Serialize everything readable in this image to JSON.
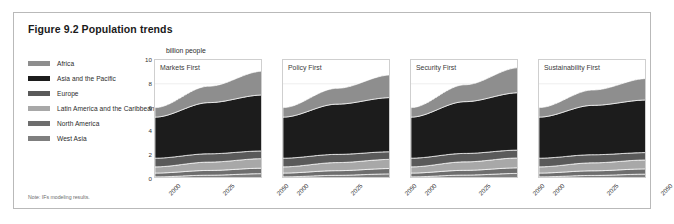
{
  "figure": {
    "title": "Figure 9.2 Population trends",
    "note": "Note: IFs modeling results."
  },
  "legend": {
    "items": [
      {
        "label": "Africa",
        "color": "#8e8e8e"
      },
      {
        "label": "Asia and the Pacific",
        "color": "#1c1c1c"
      },
      {
        "label": "Europe",
        "color": "#5a5a5a"
      },
      {
        "label": "Latin America and the Caribbean",
        "color": "#a8a8a8"
      },
      {
        "label": "North America",
        "color": "#6e6e6e"
      },
      {
        "label": "West Asia",
        "color": "#7f7f7f"
      }
    ]
  },
  "chart_data": {
    "type": "area",
    "title": "Figure 9.2 Population trends",
    "subtitle": "",
    "xlabel": "",
    "ylabel": "billion people",
    "ylim": [
      0,
      10
    ],
    "yticks": [
      10,
      8,
      6,
      4,
      2,
      0
    ],
    "xticks": [
      "2000",
      "2025",
      "2050"
    ],
    "x": [
      2000,
      2025,
      2050
    ],
    "grid": true,
    "legend_position": "left",
    "stack_order": [
      "West Asia",
      "North America",
      "Latin America and the Caribbean",
      "Europe",
      "Asia and the Pacific",
      "Africa"
    ],
    "panels": [
      {
        "title": "Markets First",
        "series": [
          {
            "name": "West Asia",
            "values": [
              0.18,
              0.32,
              0.45
            ],
            "color": "#7f7f7f"
          },
          {
            "name": "North America",
            "values": [
              0.32,
              0.4,
              0.46
            ],
            "color": "#6e6e6e"
          },
          {
            "name": "Latin America and the Caribbean",
            "values": [
              0.52,
              0.7,
              0.8
            ],
            "color": "#a8a8a8"
          },
          {
            "name": "Europe",
            "values": [
              0.73,
              0.7,
              0.65
            ],
            "color": "#5a5a5a"
          },
          {
            "name": "Asia and the Pacific",
            "values": [
              3.45,
              4.3,
              4.7
            ],
            "color": "#1c1c1c"
          },
          {
            "name": "Africa",
            "values": [
              0.8,
              1.38,
              2.0
            ],
            "color": "#8e8e8e"
          }
        ],
        "totals": [
          6.0,
          7.8,
          9.06
        ]
      },
      {
        "title": "Policy First",
        "series": [
          {
            "name": "West Asia",
            "values": [
              0.18,
              0.31,
              0.43
            ],
            "color": "#7f7f7f"
          },
          {
            "name": "North America",
            "values": [
              0.32,
              0.39,
              0.45
            ],
            "color": "#6e6e6e"
          },
          {
            "name": "Latin America and the Caribbean",
            "values": [
              0.52,
              0.68,
              0.77
            ],
            "color": "#a8a8a8"
          },
          {
            "name": "Europe",
            "values": [
              0.73,
              0.69,
              0.64
            ],
            "color": "#5a5a5a"
          },
          {
            "name": "Asia and the Pacific",
            "values": [
              3.45,
              4.22,
              4.55
            ],
            "color": "#1c1c1c"
          },
          {
            "name": "Africa",
            "values": [
              0.8,
              1.33,
              1.9
            ],
            "color": "#8e8e8e"
          }
        ],
        "totals": [
          6.0,
          7.62,
          8.74
        ]
      },
      {
        "title": "Security First",
        "series": [
          {
            "name": "West Asia",
            "values": [
              0.18,
              0.33,
              0.47
            ],
            "color": "#7f7f7f"
          },
          {
            "name": "North America",
            "values": [
              0.32,
              0.4,
              0.47
            ],
            "color": "#6e6e6e"
          },
          {
            "name": "Latin America and the Caribbean",
            "values": [
              0.52,
              0.71,
              0.83
            ],
            "color": "#a8a8a8"
          },
          {
            "name": "Europe",
            "values": [
              0.73,
              0.71,
              0.66
            ],
            "color": "#5a5a5a"
          },
          {
            "name": "Asia and the Pacific",
            "values": [
              3.45,
              4.35,
              4.82
            ],
            "color": "#1c1c1c"
          },
          {
            "name": "Africa",
            "values": [
              0.8,
              1.42,
              2.1
            ],
            "color": "#8e8e8e"
          }
        ],
        "totals": [
          6.0,
          7.92,
          9.35
        ]
      },
      {
        "title": "Sustainability First",
        "series": [
          {
            "name": "West Asia",
            "values": [
              0.18,
              0.3,
              0.41
            ],
            "color": "#7f7f7f"
          },
          {
            "name": "North America",
            "values": [
              0.32,
              0.39,
              0.44
            ],
            "color": "#6e6e6e"
          },
          {
            "name": "Latin America and the Caribbean",
            "values": [
              0.52,
              0.67,
              0.75
            ],
            "color": "#a8a8a8"
          },
          {
            "name": "Europe",
            "values": [
              0.73,
              0.68,
              0.62
            ],
            "color": "#5a5a5a"
          },
          {
            "name": "Asia and the Pacific",
            "values": [
              3.45,
              4.15,
              4.42
            ],
            "color": "#1c1c1c"
          },
          {
            "name": "Africa",
            "values": [
              0.8,
              1.29,
              1.8
            ],
            "color": "#8e8e8e"
          }
        ],
        "totals": [
          6.0,
          7.48,
          8.44
        ]
      }
    ]
  }
}
